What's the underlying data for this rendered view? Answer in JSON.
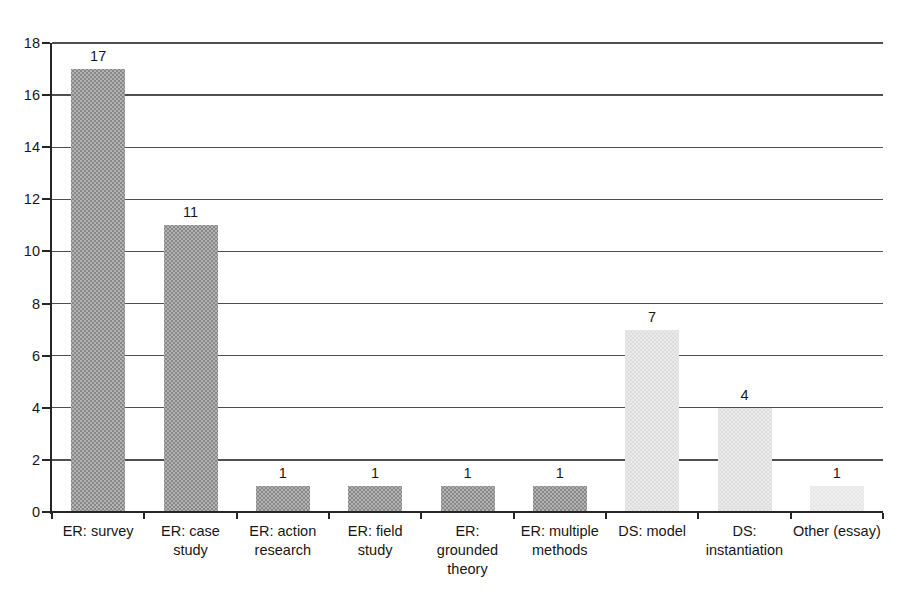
{
  "figure": {
    "background": "#ffffff"
  },
  "chart_data": {
    "type": "bar",
    "categories": [
      "ER: survey",
      "ER: case study",
      "ER: action research",
      "ER: field study",
      "ER: grounded theory",
      "ER: multiple methods",
      "DS: model",
      "DS: instantiation",
      "Other (essay)"
    ],
    "display_label_lines": [
      [
        "ER: survey"
      ],
      [
        "ER: case",
        "study"
      ],
      [
        "ER: action",
        "research"
      ],
      [
        "ER: field",
        "study"
      ],
      [
        "ER:",
        "grounded",
        "theory"
      ],
      [
        "ER: multiple",
        "methods"
      ],
      [
        "DS: model"
      ],
      [
        "DS:",
        "instantiation"
      ],
      [
        "Other (essay)"
      ]
    ],
    "values": [
      17,
      11,
      1,
      1,
      1,
      1,
      7,
      4,
      1
    ],
    "bar_value_labels": [
      "17",
      "11",
      "1",
      "1",
      "1",
      "1",
      "7",
      "4",
      "1"
    ],
    "groups": [
      "ER",
      "ER",
      "ER",
      "ER",
      "ER",
      "ER",
      "DS",
      "DS",
      "Other"
    ],
    "group_colors": {
      "ER": "#a8a8a8",
      "DS": "#e5e5e5",
      "Other": "#eeeeee"
    },
    "title": "",
    "xlabel": "",
    "ylabel": "",
    "ylim": [
      0,
      18
    ],
    "ytick_step": 2,
    "ytick_labels": [
      "0",
      "2",
      "4",
      "6",
      "8",
      "10",
      "12",
      "14",
      "16",
      "18"
    ],
    "grid": true,
    "legend": false
  },
  "style": {
    "grid_color": "#4f4f4f",
    "axis_color": "#262626",
    "text_color": "#171717"
  }
}
